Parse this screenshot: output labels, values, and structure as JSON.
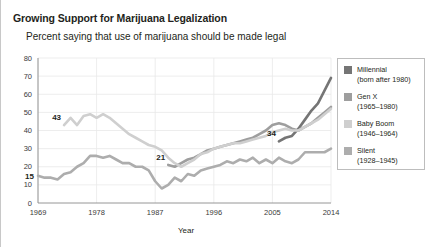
{
  "title": "Growing Support for Marijuana Legalization",
  "subtitle": "Percent saying that use of marijuana should be made legal",
  "legend": {
    "items": [
      {
        "name": "Millennial",
        "years": "(born after 1980)",
        "color": "#757575"
      },
      {
        "name": "Gen X",
        "years": "(1965–1980)",
        "color": "#9e9e9e"
      },
      {
        "name": "Baby Boom",
        "years": "(1946–1964)",
        "color": "#cfcfcf"
      },
      {
        "name": "Silent",
        "years": "(1928–1945)",
        "color": "#adadad"
      }
    ]
  },
  "chart_data": {
    "type": "line",
    "title": "Growing Support for Marijuana Legalization",
    "subtitle": "Percent saying that use of marijuana should be made legal",
    "xlabel": "Year",
    "ylabel": "",
    "xlim": [
      1969,
      2014
    ],
    "ylim": [
      0,
      80
    ],
    "yticks": [
      0,
      10,
      20,
      30,
      40,
      50,
      60,
      70,
      80
    ],
    "xticks": [
      1969,
      1978,
      1987,
      1996,
      2005,
      2014
    ],
    "grid": true,
    "legend_position": "right",
    "annotations": [
      {
        "text": "15",
        "series": "Silent",
        "x": 1969,
        "y": 15
      },
      {
        "text": "43",
        "series": "Baby Boom",
        "x": 1973,
        "y": 43
      },
      {
        "text": "21",
        "series": "Gen X",
        "x": 1989,
        "y": 21
      },
      {
        "text": "34",
        "series": "Millennial",
        "x": 2006,
        "y": 34
      },
      {
        "text": "69",
        "series": "Millennial",
        "x": 2014,
        "y": 69
      },
      {
        "text": "53",
        "series": "Gen X",
        "x": 2014,
        "y": 53
      },
      {
        "text": "52",
        "series": "Baby Boom",
        "x": 2014,
        "y": 52
      },
      {
        "text": "30",
        "series": "Silent",
        "x": 2014,
        "y": 30
      }
    ],
    "series": [
      {
        "name": "Millennial",
        "color": "#757575",
        "x": [
          2006,
          2007,
          2008,
          2009,
          2010,
          2011,
          2012,
          2013,
          2014
        ],
        "values": [
          34,
          36,
          37,
          41,
          46,
          51,
          55,
          62,
          69
        ]
      },
      {
        "name": "Gen X",
        "color": "#9e9e9e",
        "x": [
          1989,
          1990,
          1991,
          1992,
          1993,
          1994,
          1995,
          1996,
          1997,
          1998,
          1999,
          2000,
          2001,
          2002,
          2003,
          2004,
          2005,
          2006,
          2007,
          2008,
          2009,
          2010,
          2011,
          2012,
          2013,
          2014
        ],
        "values": [
          21,
          20,
          22,
          24,
          25,
          27,
          29,
          30,
          31,
          32,
          33,
          34,
          35,
          36,
          38,
          40,
          43,
          44,
          43,
          41,
          40,
          42,
          44,
          47,
          50,
          53
        ]
      },
      {
        "name": "Baby Boom",
        "color": "#cfcfcf",
        "x": [
          1973,
          1974,
          1975,
          1976,
          1977,
          1978,
          1979,
          1980,
          1981,
          1982,
          1983,
          1984,
          1985,
          1986,
          1987,
          1988,
          1989,
          1990,
          1991,
          1992,
          1993,
          1994,
          1995,
          1996,
          1997,
          1998,
          1999,
          2000,
          2001,
          2002,
          2003,
          2004,
          2005,
          2006,
          2007,
          2008,
          2009,
          2010,
          2011,
          2012,
          2013,
          2014
        ],
        "values": [
          43,
          47,
          43,
          48,
          49,
          47,
          49,
          47,
          44,
          41,
          38,
          36,
          34,
          32,
          31,
          29,
          25,
          22,
          20,
          22,
          24,
          27,
          28,
          30,
          31,
          32,
          33,
          33,
          34,
          35,
          36,
          37,
          39,
          40,
          41,
          40,
          40,
          42,
          44,
          46,
          49,
          52
        ]
      },
      {
        "name": "Silent",
        "color": "#adadad",
        "x": [
          1969,
          1970,
          1971,
          1972,
          1973,
          1974,
          1975,
          1976,
          1977,
          1978,
          1979,
          1980,
          1981,
          1982,
          1983,
          1984,
          1985,
          1986,
          1987,
          1988,
          1989,
          1990,
          1991,
          1992,
          1993,
          1994,
          1995,
          1996,
          1997,
          1998,
          1999,
          2000,
          2001,
          2002,
          2003,
          2004,
          2005,
          2006,
          2007,
          2008,
          2009,
          2010,
          2011,
          2012,
          2013,
          2014
        ],
        "values": [
          15,
          14,
          14,
          13,
          16,
          17,
          20,
          22,
          26,
          26,
          25,
          26,
          24,
          22,
          22,
          20,
          20,
          18,
          12,
          8,
          10,
          14,
          12,
          16,
          15,
          18,
          19,
          20,
          21,
          23,
          22,
          24,
          23,
          25,
          22,
          24,
          22,
          25,
          23,
          22,
          24,
          28,
          28,
          28,
          28,
          30
        ]
      }
    ]
  }
}
